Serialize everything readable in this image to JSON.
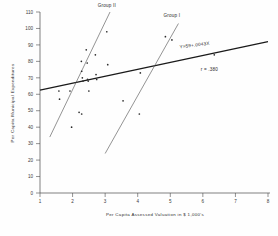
{
  "chart_data": {
    "type": "scatter",
    "title": "",
    "xlabel": "Per Capita  Assessed Valuation in $ 1,000's",
    "ylabel": "Per Capita Municipal Expenditures",
    "xlim": [
      1,
      8
    ],
    "ylim": [
      0,
      110
    ],
    "xticks": [
      1,
      2,
      3,
      4,
      5,
      6,
      7,
      8
    ],
    "yticks": [
      0,
      10,
      20,
      30,
      40,
      50,
      60,
      70,
      80,
      90,
      100,
      110
    ],
    "grid": false,
    "legend": "none",
    "points": [
      {
        "x": 1.58,
        "y": 62
      },
      {
        "x": 1.6,
        "y": 57
      },
      {
        "x": 1.92,
        "y": 62
      },
      {
        "x": 1.97,
        "y": 40
      },
      {
        "x": 2.2,
        "y": 49
      },
      {
        "x": 2.28,
        "y": 48
      },
      {
        "x": 2.27,
        "y": 80
      },
      {
        "x": 2.28,
        "y": 74
      },
      {
        "x": 2.3,
        "y": 70
      },
      {
        "x": 2.32,
        "y": 68
      },
      {
        "x": 2.42,
        "y": 87
      },
      {
        "x": 2.45,
        "y": 79
      },
      {
        "x": 2.46,
        "y": 69
      },
      {
        "x": 2.48,
        "y": 68
      },
      {
        "x": 2.5,
        "y": 62
      },
      {
        "x": 2.7,
        "y": 84
      },
      {
        "x": 2.72,
        "y": 72
      },
      {
        "x": 2.74,
        "y": 69
      },
      {
        "x": 3.05,
        "y": 98
      },
      {
        "x": 3.08,
        "y": 78
      },
      {
        "x": 3.55,
        "y": 56
      },
      {
        "x": 4.05,
        "y": 48
      },
      {
        "x": 4.08,
        "y": 73
      },
      {
        "x": 4.85,
        "y": 95
      },
      {
        "x": 5.05,
        "y": 93
      },
      {
        "x": 6.35,
        "y": 84
      }
    ],
    "lines": [
      {
        "name": "overall-regression",
        "label": "Y=59+.0043X",
        "x0": 1.0,
        "y0": 62.5,
        "x1": 8.0,
        "y1": 92.0
      },
      {
        "name": "group-ii-line",
        "label": "Group II",
        "x0": 1.3,
        "y0": 34.0,
        "x1": 3.15,
        "y1": 110.0
      },
      {
        "name": "group-i-line",
        "label": "Group I",
        "x0": 3.0,
        "y0": 24.0,
        "x1": 5.25,
        "y1": 103.0
      }
    ],
    "annotations": [
      {
        "name": "group-ii-label",
        "text": "Group II",
        "x": 3.05,
        "y": 113
      },
      {
        "name": "group-i-label",
        "text": "Group I",
        "x": 5.05,
        "y": 107
      },
      {
        "name": "equation-label",
        "text": "Y=59+.0043X",
        "x": 5.75,
        "y": 89
      },
      {
        "name": "correlation-label",
        "text": "r = .380",
        "x": 6.2,
        "y": 74
      }
    ],
    "colors": {
      "axis": "#4a4a4a",
      "point": "#2b2b2b",
      "regression": "#1a1a1a",
      "group_line": "#5a5a5a",
      "background": "#fefefe"
    }
  }
}
